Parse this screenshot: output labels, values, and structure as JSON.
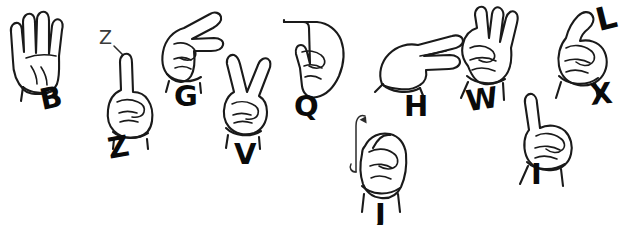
{
  "figure": {
    "background_color": "#ffffff",
    "ink_color": "#1a1a1a",
    "label_color": "#0a0a0a",
    "width": 623,
    "height": 225
  },
  "signs": [
    {
      "id": "sign-b",
      "letter": "B",
      "icon": "hand-flat-four-fingers-up-thumb-across-palm-icon",
      "description": "flat open palm, four fingers extended upward together, thumb folded across palm",
      "label_x": 40,
      "label_y": 84,
      "hand_x": 4,
      "hand_y": 4
    },
    {
      "id": "sign-z",
      "letter": "Z",
      "icon": "hand-index-finger-up-fist-icon",
      "description": "closed fist with index finger pointing up, traced in a Z motion",
      "label_x": 108,
      "label_y": 133,
      "hand_x": 95,
      "hand_y": 50,
      "motion": {
        "letter": "Z",
        "icon": "z-motion-trace-icon",
        "x": 99,
        "y": 28
      }
    },
    {
      "id": "sign-g",
      "letter": "G",
      "icon": "hand-index-and-thumb-pointing-sideways-icon",
      "description": "fist with index finger and thumb extended horizontally, parallel",
      "label_x": 174,
      "label_y": 82,
      "hand_x": 150,
      "hand_y": 4
    },
    {
      "id": "sign-v",
      "letter": "V",
      "icon": "hand-two-fingers-up-v-shape-icon",
      "description": "fist with index and middle fingers extended upward in a V",
      "label_x": 234,
      "label_y": 140,
      "hand_x": 212,
      "hand_y": 52
    },
    {
      "id": "sign-q",
      "letter": "Q",
      "icon": "hand-index-and-thumb-pointing-downward-icon",
      "description": "hand pointing downward with index finger and thumb extended",
      "label_x": 294,
      "label_y": 92,
      "hand_x": 272,
      "hand_y": 8
    },
    {
      "id": "sign-j",
      "letter": "J",
      "icon": "hand-pinky-up-with-j-hook-motion-icon",
      "description": "fist with pinky extended, traced in a J hook motion",
      "label_x": 375,
      "label_y": 200,
      "hand_x": 340,
      "hand_y": 108,
      "motion": {
        "letter": "",
        "icon": "j-hook-motion-arrow-icon",
        "x": 347,
        "y": 112
      }
    },
    {
      "id": "sign-h",
      "letter": "H",
      "icon": "hand-two-fingers-sideways-icon",
      "description": "fist turned sideways with index and middle fingers extended horizontally",
      "label_x": 404,
      "label_y": 92,
      "hand_x": 370,
      "hand_y": 26
    },
    {
      "id": "sign-w",
      "letter": "W",
      "icon": "hand-three-fingers-up-icon",
      "description": "three fingers extended upward, thumb holding pinky down",
      "label_x": 466,
      "label_y": 85,
      "hand_x": 448,
      "hand_y": 4
    },
    {
      "id": "sign-i",
      "letter": "I",
      "icon": "hand-pinky-up-icon",
      "description": "closed fist with pinky finger extended upward",
      "label_x": 531,
      "label_y": 160,
      "hand_x": 508,
      "hand_y": 92
    },
    {
      "id": "sign-x",
      "letter": "X",
      "icon": "hand-hooked-index-finger-icon",
      "description": "closed fist with index finger bent into a hook",
      "label_x": 590,
      "label_y": 80,
      "hand_x": 540,
      "hand_y": 4
    },
    {
      "id": "sign-l",
      "letter": "L",
      "icon": "letter-l-label-icon",
      "description": "letter L label at upper right corner",
      "label_x": 596,
      "label_y": 2,
      "hand_x": null,
      "hand_y": null
    }
  ]
}
